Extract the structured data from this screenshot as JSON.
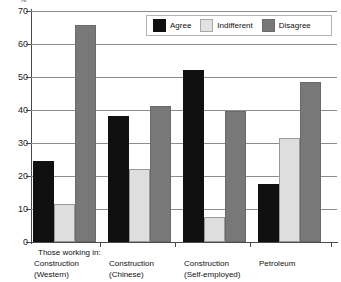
{
  "chart_data": {
    "type": "bar",
    "title": "",
    "subtitle": "",
    "xlabel": "",
    "ylabel": "%",
    "axis_unit": "%",
    "ylim": [
      0,
      70
    ],
    "yticks": [
      0,
      10,
      20,
      30,
      40,
      50,
      60,
      70
    ],
    "grid": true,
    "legend_position": "top-center",
    "group_note": "Those working in:",
    "categories": [
      "Construction\n(Western)",
      "Construction\n(Chinese)",
      "Construction\n(Self-employed)",
      "Petroleum"
    ],
    "series": [
      {
        "name": "Agree",
        "color": "#101010",
        "values": [
          24,
          37.5,
          51.5,
          17
        ]
      },
      {
        "name": "Indifferent",
        "color": "#dedede",
        "values": [
          11,
          21.5,
          7,
          31
        ]
      },
      {
        "name": "Disagree",
        "color": "#787878",
        "values": [
          65,
          40.5,
          39,
          48
        ]
      }
    ]
  }
}
